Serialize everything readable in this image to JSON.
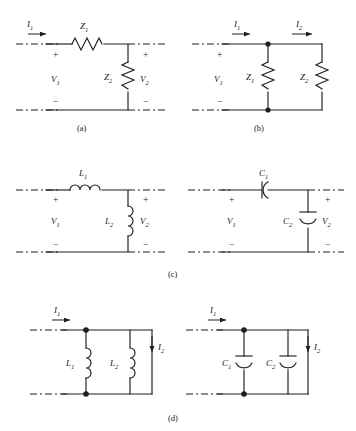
{
  "figure": {
    "type": "circuit-diagram",
    "panel_count": 4,
    "line_color": "#1f1f1f",
    "background": "#ffffff"
  },
  "symbols": {
    "plus": "+",
    "minus": "−"
  },
  "panels": [
    {
      "id": "a",
      "caption": "(a)",
      "topology": "L-section: series element with shunt element",
      "labels": {
        "current_in": "I",
        "current_in_sub": "1",
        "series_element": "Z",
        "series_element_sub": "1",
        "shunt_element": "Z",
        "shunt_element_sub": "2",
        "voltage_in": "V",
        "voltage_in_sub": "1",
        "voltage_out": "V",
        "voltage_out_sub": "2"
      },
      "components": [
        "resistor-series-Z1",
        "resistor-shunt-Z2"
      ]
    },
    {
      "id": "b",
      "caption": "(b)",
      "topology": "Two shunt impedances across the port",
      "labels": {
        "current_in": "I",
        "current_in_sub": "1",
        "current_out": "I",
        "current_out_sub": "2",
        "element_one": "Z",
        "element_one_sub": "1",
        "element_two": "Z",
        "element_two_sub": "2",
        "voltage_in": "V",
        "voltage_in_sub": "1"
      },
      "components": [
        "resistor-shunt-Z1",
        "resistor-shunt-Z2"
      ]
    },
    {
      "id": "c",
      "caption": "(c)",
      "topology": "L-section realizations: inductive (left) and capacitive (right)",
      "left": {
        "series_element": "L",
        "series_element_sub": "1",
        "shunt_element": "L",
        "shunt_element_sub": "2",
        "voltage_in": "V",
        "voltage_in_sub": "1",
        "voltage_out": "V",
        "voltage_out_sub": "2",
        "components": [
          "inductor-series-L1",
          "inductor-shunt-L2"
        ]
      },
      "right": {
        "series_element": "C",
        "series_element_sub": "1",
        "shunt_element": "C",
        "shunt_element_sub": "2",
        "voltage_in": "V",
        "voltage_in_sub": "1",
        "voltage_out": "V",
        "voltage_out_sub": "2",
        "components": [
          "capacitor-series-C1",
          "capacitor-shunt-C2"
        ]
      }
    },
    {
      "id": "d",
      "caption": "(d)",
      "topology": "Parallel element pairs: inductive (left) and capacitive (right)",
      "left": {
        "current_in": "I",
        "current_in_sub": "1",
        "current_out": "I",
        "current_out_sub": "2",
        "element_one": "L",
        "element_one_sub": "1",
        "element_two": "L",
        "element_two_sub": "2",
        "components": [
          "inductor-shunt-L1",
          "inductor-shunt-L2"
        ]
      },
      "right": {
        "current_in": "I",
        "current_in_sub": "1",
        "current_out": "I",
        "current_out_sub": "2",
        "element_one": "C",
        "element_one_sub": "1",
        "element_two": "C",
        "element_two_sub": "2",
        "components": [
          "capacitor-shunt-C1",
          "capacitor-shunt-C2"
        ]
      }
    }
  ]
}
